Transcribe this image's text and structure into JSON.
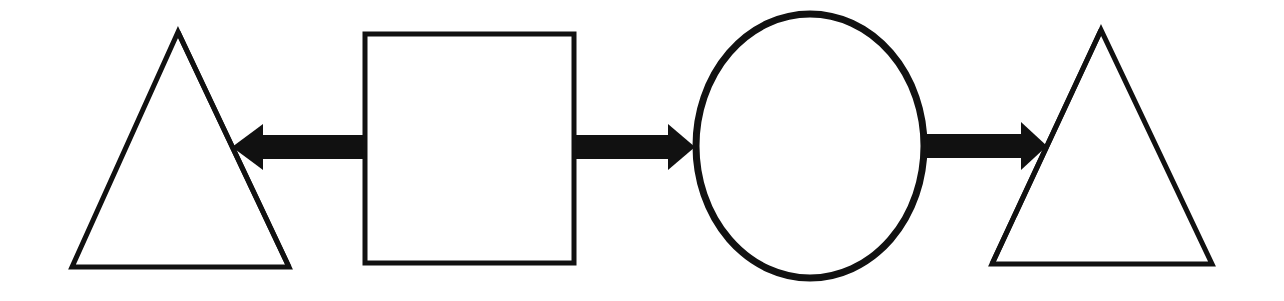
{
  "diagram": {
    "stroke_color": "#111111",
    "fill_color": "#ffffff",
    "background": "#ffffff",
    "nodes": [
      {
        "id": "triangle-left",
        "shape": "triangle",
        "label": ""
      },
      {
        "id": "square",
        "shape": "square",
        "label": ""
      },
      {
        "id": "circle",
        "shape": "ellipse",
        "label": ""
      },
      {
        "id": "triangle-right",
        "shape": "triangle",
        "label": ""
      }
    ],
    "edges": [
      {
        "from": "square",
        "to": "triangle-left",
        "style": "thick-block-arrow",
        "direction": "left"
      },
      {
        "from": "square",
        "to": "circle",
        "style": "thick-block-arrow",
        "direction": "right"
      },
      {
        "from": "circle",
        "to": "triangle-right",
        "style": "thick-block-arrow",
        "direction": "right"
      }
    ]
  }
}
